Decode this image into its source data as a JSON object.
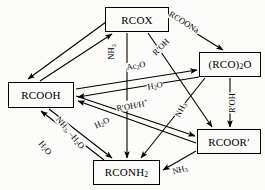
{
  "diagram": {
    "type": "reaction-scheme",
    "background_color": "#fbfbf9",
    "line_color": "#000000",
    "nodes": [
      {
        "id": "rcox",
        "label": "RCOX",
        "label_html": "RCOX",
        "x": 105,
        "y": 7,
        "w": 64,
        "h": 25
      },
      {
        "id": "anhyd",
        "label": "(RCO)2O",
        "label_html": "(RCO)<sub>2</sub>O",
        "x": 199,
        "y": 52,
        "w": 62,
        "h": 25
      },
      {
        "id": "rcooh",
        "label": "RCOOH",
        "label_html": "RCOOH",
        "x": 8,
        "y": 82,
        "w": 66,
        "h": 26
      },
      {
        "id": "rcoor",
        "label": "RCOOR'",
        "label_html": "RCOOR&#8242;",
        "x": 197,
        "y": 129,
        "w": 64,
        "h": 25
      },
      {
        "id": "rconh2",
        "label": "RCONH2",
        "label_html": "RCONH<sub>2</sub>",
        "x": 93,
        "y": 160,
        "w": 67,
        "h": 25
      }
    ],
    "edge_labels": [
      {
        "id": "rcoona",
        "text": "RCOONa",
        "text_html": "RCOONa",
        "x": 184,
        "y": 22,
        "rotate": 32
      },
      {
        "id": "nh3-top",
        "text": "NH3",
        "text_html": "NH<sub>3</sub>",
        "x": 112,
        "y": 52,
        "rotate": -90
      },
      {
        "id": "ac2o",
        "text": "Ac2O",
        "text_html": "Ac<sub>2</sub>O",
        "x": 136,
        "y": 66,
        "rotate": -10
      },
      {
        "id": "rpoh-top",
        "text": "R'OH",
        "text_html": "R&#8242;OH",
        "x": 161,
        "y": 47,
        "rotate": -46
      },
      {
        "id": "h2o-mid",
        "text": "H2O",
        "text_html": "H<sub>2</sub>O",
        "x": 155,
        "y": 86,
        "rotate": -10
      },
      {
        "id": "rpohh",
        "text": "R'OH/H+",
        "text_html": "R&#8242;OH/H<sup>+</sup>",
        "x": 132,
        "y": 105,
        "rotate": -10
      },
      {
        "id": "nh3-right",
        "text": "NH3",
        "text_html": "NH<sub>3</sub>",
        "x": 181,
        "y": 110,
        "rotate": -62
      },
      {
        "id": "rpoh-right",
        "text": "R'OH",
        "text_html": "R&#8242;OH",
        "x": 232,
        "y": 103,
        "rotate": -90
      },
      {
        "id": "h2o-left",
        "text": "H2O",
        "text_html": "H<sub>2</sub>O",
        "x": 102,
        "y": 123,
        "rotate": -25
      },
      {
        "id": "nh3-h2o",
        "text": "NH3, -H2O",
        "text_html": "NH<sub>3</sub>, &#8211;H<sub>2</sub>O",
        "x": 70,
        "y": 133,
        "rotate": 50
      },
      {
        "id": "h2o-bl",
        "text": "H2O",
        "text_html": "H<sub>2</sub>O",
        "x": 45,
        "y": 148,
        "rotate": 50
      },
      {
        "id": "nh3-bot",
        "text": "NH3",
        "text_html": "NH<sub>3</sub>",
        "x": 180,
        "y": 170,
        "rotate": -14
      }
    ],
    "edges": [
      {
        "id": "rcox-to-rcooh",
        "from": "RCOX",
        "to": "RCOOH",
        "reagent": "H2O",
        "arrow": "single"
      },
      {
        "id": "rcooh-to-rcox",
        "from": "RCOOH",
        "to": "RCOX",
        "reagent": "",
        "arrow": "single"
      },
      {
        "id": "rcox-to-anhydride",
        "from": "RCOX",
        "to": "(RCO)2O",
        "reagent": "RCOONa",
        "arrow": "single"
      },
      {
        "id": "rcox-to-rconh2",
        "from": "RCOX",
        "to": "RCONH2",
        "reagent": "NH3",
        "arrow": "single"
      },
      {
        "id": "rcox-to-rcoor",
        "from": "RCOX",
        "to": "RCOOR'",
        "reagent": "R'OH",
        "arrow": "single"
      },
      {
        "id": "rcooh-to-anhydride",
        "from": "RCOOH",
        "to": "(RCO)2O",
        "reagent": "Ac2O",
        "arrow": "single"
      },
      {
        "id": "anhydride-to-rcooh",
        "from": "(RCO)2O",
        "to": "RCOOH",
        "reagent": "H2O",
        "arrow": "single"
      },
      {
        "id": "anhydride-to-rcoor",
        "from": "(RCO)2O",
        "to": "RCOOR'",
        "reagent": "R'OH",
        "arrow": "single"
      },
      {
        "id": "anhydride-to-rconh2",
        "from": "(RCO)2O",
        "to": "RCONH2",
        "reagent": "NH3",
        "arrow": "single"
      },
      {
        "id": "rcooh-to-rcoor",
        "from": "RCOOH",
        "to": "RCOOR'",
        "reagent": "R'OH/H+",
        "arrow": "single"
      },
      {
        "id": "rcoor-to-rcooh",
        "from": "RCOOR'",
        "to": "RCOOH",
        "reagent": "H2O",
        "arrow": "single"
      },
      {
        "id": "rcooh-to-rconh2",
        "from": "RCOOH",
        "to": "RCONH2",
        "reagent": "NH3, -H2O",
        "arrow": "single"
      },
      {
        "id": "rconh2-to-rcooh",
        "from": "RCONH2",
        "to": "RCOOH",
        "reagent": "H2O",
        "arrow": "single"
      },
      {
        "id": "rcoor-to-rconh2",
        "from": "RCOOR'",
        "to": "RCONH2",
        "reagent": "NH3",
        "arrow": "single"
      }
    ]
  }
}
